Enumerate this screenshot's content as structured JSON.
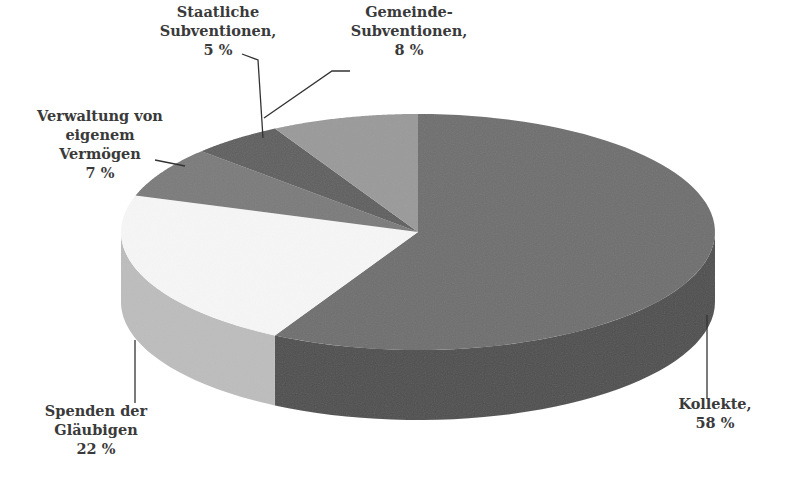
{
  "chart_data": {
    "type": "pie",
    "style": "3d",
    "title": "",
    "slices": [
      {
        "label": "Kollekte",
        "value": 58,
        "display": [
          "Kollekte,",
          "58 %"
        ],
        "color_top": "#6e6e6e",
        "color_side": "#4e4e4e"
      },
      {
        "label": "Spenden der Gläubigen",
        "value": 22,
        "display": [
          "Spenden der",
          "Gläubigen",
          "22 %"
        ],
        "color_top": "#f7f7f7",
        "color_side": "#bdbdbd"
      },
      {
        "label": "Verwaltung von eigenem Vermögen",
        "value": 7,
        "display": [
          "Verwaltung von",
          "eigenem",
          "Vermögen",
          "7 %"
        ],
        "color_top": "#7a7a7a",
        "color_side": "#5a5a5a"
      },
      {
        "label": "Staatliche Subventionen",
        "value": 5,
        "display": [
          "Staatliche",
          "Subventionen,",
          "5 %"
        ],
        "color_top": "#5e5e5e",
        "color_side": "#444444"
      },
      {
        "label": "Gemeinde-Subventionen",
        "value": 8,
        "display": [
          "Gemeinde-",
          "Subventionen,",
          "8 %"
        ],
        "color_top": "#9a9a9a",
        "color_side": "#777777"
      }
    ],
    "start_angle": "12 o'clock",
    "direction": "clockwise",
    "legend": "none (callout labels)",
    "units": "%"
  }
}
